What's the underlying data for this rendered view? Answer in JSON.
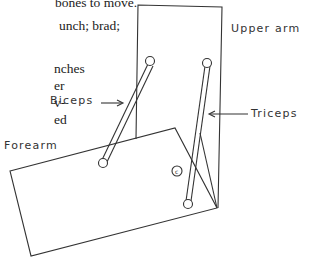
{
  "text_fragments": [
    "bones to move.",
    "unch; brad;",
    "nches",
    "er",
    "v-",
    "ed"
  ],
  "labels": {
    "upper_arm": "Upper arm",
    "biceps": "Biceps",
    "triceps": "Triceps",
    "forearm": "Forearm"
  },
  "elbow_symbol": "c"
}
